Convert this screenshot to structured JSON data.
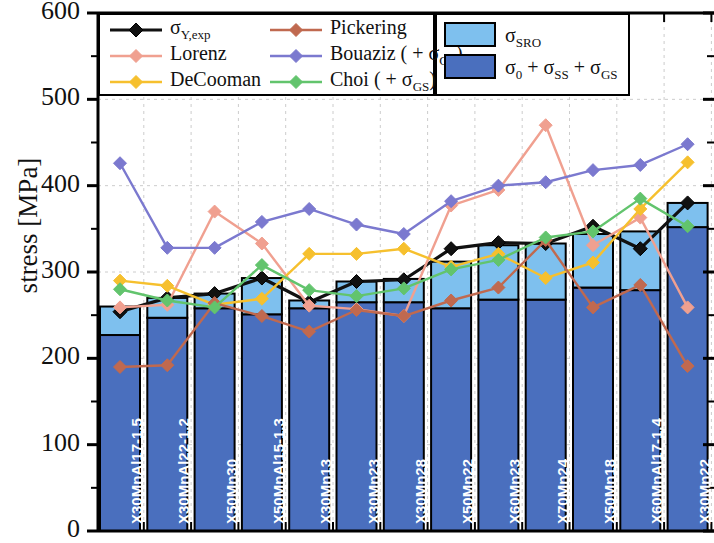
{
  "chart_data": {
    "type": "bar",
    "title": "",
    "xlabel": "",
    "ylabel": "stress [MPa]",
    "ylim": [
      0,
      600
    ],
    "yticks": [
      0,
      100,
      200,
      300,
      400,
      500,
      600
    ],
    "ytick_labels": [
      "0",
      "100",
      "200",
      "300",
      "400",
      "500",
      "600"
    ],
    "grid": true,
    "legend_position": "top",
    "categories": [
      "X30MnAl17-1.5",
      "X30MnAl22-1.2",
      "X50Mn30",
      "X50MnAl15-1.3",
      "X30Mn13",
      "X30Mn23",
      "X30Mn28",
      "X50Mn22",
      "X60Mn23",
      "X70Mn24",
      "X50Mn18",
      "X60MnAl17-1.4",
      "X30Mn22"
    ],
    "stacked_bars": {
      "segments": [
        {
          "name": "sigma_0 + sigma_SS + sigma_GS",
          "label": "σ<sub>0</sub> + σ<sub>SS</sub> + σ<sub>GS</sub>",
          "color": "#4a6fbe",
          "values": [
            227,
            247,
            258,
            251,
            258,
            265,
            265,
            258,
            268,
            268,
            282,
            279,
            352
          ]
        },
        {
          "name": "sigma_SRO",
          "label": "σ<sub>SRO</sub>",
          "color": "#7ec0ee",
          "values": [
            33,
            23,
            17,
            42,
            9,
            24,
            27,
            54,
            63,
            65,
            62,
            68,
            28
          ]
        }
      ],
      "totals": [
        260,
        270,
        275,
        293,
        267,
        289,
        292,
        312,
        331,
        333,
        344,
        347,
        380
      ]
    },
    "series": [
      {
        "name": "sigma_Y,exp",
        "label": "σ<sub>Y,exp</sub>",
        "color": "#111111",
        "marker": "diamond",
        "values": [
          254,
          270,
          275,
          293,
          265,
          289,
          291,
          327,
          334,
          333,
          353,
          327,
          380
        ]
      },
      {
        "name": "Lorenz",
        "label": "Lorenz",
        "color": "#f0a090",
        "marker": "diamond",
        "values": [
          259,
          262,
          370,
          333,
          261,
          257,
          249,
          377,
          395,
          470,
          331,
          363,
          259
        ]
      },
      {
        "name": "DeCooman",
        "label": "DeCooman",
        "color": "#f6c02e",
        "marker": "diamond",
        "values": [
          290,
          284,
          262,
          269,
          321,
          321,
          327,
          306,
          321,
          293,
          311,
          373,
          427
        ]
      },
      {
        "name": "Pickering",
        "label": "Pickering",
        "color": "#c0694f",
        "marker": "diamond",
        "values": [
          190,
          192,
          264,
          249,
          231,
          256,
          249,
          267,
          282,
          337,
          259,
          285,
          191
        ]
      },
      {
        "name": "Bouaziz (+ sigma_GS)",
        "label": "Bouaziz ( + σ<sub>GS</sub>)",
        "color": "#7b79cf",
        "marker": "diamond",
        "values": [
          426,
          328,
          328,
          358,
          373,
          355,
          344,
          382,
          400,
          404,
          418,
          424,
          448
        ]
      },
      {
        "name": "Choi (+ sigma_GS)",
        "label": "Choi ( + σ<sub>GS</sub>)",
        "color": "#62c46d",
        "marker": "diamond",
        "values": [
          280,
          267,
          259,
          308,
          279,
          272,
          281,
          303,
          314,
          340,
          347,
          385,
          353
        ]
      }
    ],
    "legend": {
      "left_column": [
        "σ<sub>Y,exp</sub>",
        "Lorenz",
        "DeCooman"
      ],
      "right_column": [
        "Pickering",
        "Bouaziz ( + σ<sub>GS</sub>)",
        "Choi ( + σ<sub>GS</sub>)"
      ],
      "swatch_column": [
        "σ<sub>SRO</sub>",
        "σ<sub>0</sub> + σ<sub>SS</sub> + σ<sub>GS</sub>"
      ]
    },
    "colors": {
      "sigma_SRO_fill": "#7ec0ee",
      "sigma_base_fill": "#4a6fbe",
      "axis": "#000000",
      "grid": "#cccccc"
    }
  }
}
